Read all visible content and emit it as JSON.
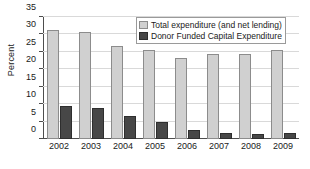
{
  "chart_data": {
    "type": "bar",
    "title": "",
    "xlabel": "",
    "ylabel": "Percent",
    "ylim": [
      0,
      35
    ],
    "yticks": [
      0,
      5,
      10,
      15,
      20,
      25,
      30,
      35
    ],
    "grid": true,
    "legend_position": "top-right",
    "categories": [
      "2002",
      "2003",
      "2004",
      "2005",
      "2006",
      "2007",
      "2008",
      "2009"
    ],
    "series": [
      {
        "name": "Total expenditure (and net lending)",
        "color": "#d0d0d0",
        "values": [
          31.2,
          30.8,
          26.6,
          25.5,
          23.1,
          24.5,
          24.3,
          25.4
        ]
      },
      {
        "name": "Donor Funded Capital Expenditure",
        "color": "#474747",
        "values": [
          9.4,
          8.8,
          6.5,
          5.0,
          2.5,
          1.6,
          1.3,
          1.8
        ]
      }
    ]
  },
  "axis": {
    "y_title": "Percent"
  },
  "legend": {
    "entries": [
      {
        "label": "Total expenditure (and net lending)",
        "swatch": "light-gray-square"
      },
      {
        "label": "Donor Funded Capital Expenditure",
        "swatch": "dark-gray-square"
      }
    ]
  }
}
